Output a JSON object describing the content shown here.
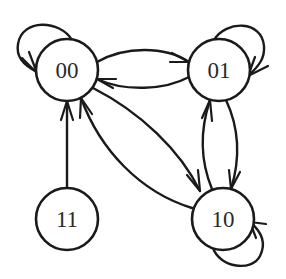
{
  "diagram": {
    "type": "state-transition-graph",
    "stroke_color": "#1a1a1a",
    "background": "#ffffff",
    "nodes": [
      {
        "id": "00",
        "label": "00",
        "cx": 67,
        "cy": 70,
        "r": 31
      },
      {
        "id": "01",
        "label": "01",
        "cx": 219,
        "cy": 70,
        "r": 31
      },
      {
        "id": "11",
        "label": "11",
        "cx": 67,
        "cy": 219,
        "r": 31
      },
      {
        "id": "10",
        "label": "10",
        "cx": 223,
        "cy": 219,
        "r": 31
      }
    ],
    "edges": [
      {
        "from": "00",
        "to": "00",
        "kind": "self-loop"
      },
      {
        "from": "01",
        "to": "01",
        "kind": "self-loop"
      },
      {
        "from": "10",
        "to": "10",
        "kind": "self-loop"
      },
      {
        "from": "00",
        "to": "01",
        "kind": "curved-upper"
      },
      {
        "from": "01",
        "to": "00",
        "kind": "curved-lower"
      },
      {
        "from": "11",
        "to": "00",
        "kind": "straight"
      },
      {
        "from": "00",
        "to": "10",
        "kind": "curved"
      },
      {
        "from": "10",
        "to": "00",
        "kind": "curved"
      },
      {
        "from": "10",
        "to": "01",
        "kind": "curved-left"
      },
      {
        "from": "01",
        "to": "10",
        "kind": "curved-right"
      }
    ]
  }
}
